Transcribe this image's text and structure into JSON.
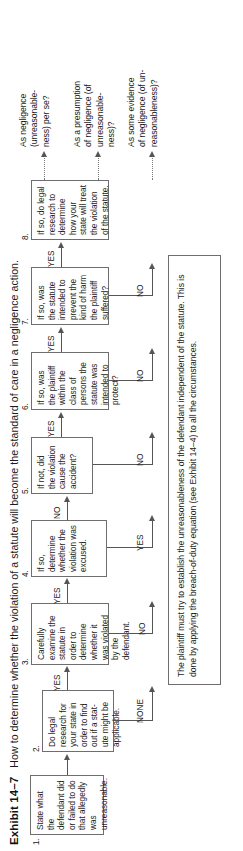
{
  "exhibit": {
    "label": "Exhibit 14–7",
    "title": "How to determine whether the violation of a statute will become the standard of care in a negligence action."
  },
  "flow": {
    "nodes": [
      {
        "num": "1.",
        "text": "State what the defendant did or failed to do that allegedly was unreasonable."
      },
      {
        "num": "2.",
        "text": "Do legal research for your state in order to find out if a stat-ute might be applicable."
      },
      {
        "num": "3.",
        "text": "Carefully examine the statute in order to determine whether it was violated by the defendant."
      },
      {
        "num": "4.",
        "text": "If so, determine whether the violation was excused."
      },
      {
        "num": "5.",
        "text": "If not, did the violation cause the accident?"
      },
      {
        "num": "6.",
        "text": "If so, was the plaintiff within the class of persons the statute was intended to protect?"
      },
      {
        "num": "7.",
        "text": "If so, was the statute intended to prevent the kind of harm the plaintiff suffered?"
      },
      {
        "num": "8.",
        "text": "If so, do legal research to determine how your state will treat the violation of the statute."
      }
    ],
    "chain_labels": [
      "YES",
      "YES",
      "YES",
      "YES",
      "YES"
    ],
    "exit_labels": [
      "NONE",
      "NO",
      "YES",
      "NO",
      "NO",
      "NO"
    ]
  },
  "outcomes": [
    "As negligence (unreasonable-ness) per se?",
    "As a presumption of negligence (of unreasonable-ness)?",
    "As some evidence of negligence (of un-reasonableness)?"
  ],
  "summary": {
    "text": "The plaintiff must try to establish the unreasonableness of the defendant independent of the statute. This is done by applying the breach-of-duty equation (see Exhibit 14–4) to all the circumstances."
  }
}
